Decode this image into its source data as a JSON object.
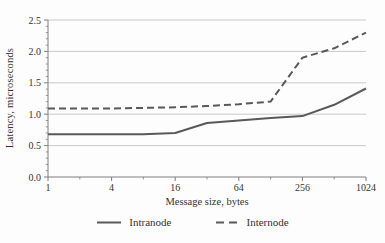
{
  "chart_data": {
    "type": "line",
    "title": "",
    "xlabel": "Message size, bytes",
    "ylabel": "Latency, microseconds",
    "x_scale": "log",
    "x": [
      1,
      2,
      4,
      8,
      16,
      32,
      64,
      128,
      256,
      512,
      1024
    ],
    "x_major_ticks": [
      1,
      4,
      16,
      64,
      256,
      1024
    ],
    "x_tick_labels": [
      "1",
      "4",
      "16",
      "64",
      "256",
      "1024"
    ],
    "x_minor_ticks": [
      2,
      8,
      32,
      128,
      512
    ],
    "ylim": [
      0.0,
      2.5
    ],
    "y_major_step": 0.5,
    "y_minor_step": 0.1,
    "y_tick_labels": [
      "0.0",
      "0.5",
      "1.0",
      "1.5",
      "2.0",
      "2.5"
    ],
    "grid": "horizontal-major",
    "legend_position": "bottom-center",
    "series": [
      {
        "name": "Intranode",
        "line": "solid",
        "color": "#595959",
        "values": [
          0.68,
          0.68,
          0.68,
          0.68,
          0.7,
          0.86,
          0.9,
          0.94,
          0.97,
          1.15,
          1.41
        ]
      },
      {
        "name": "Internode",
        "line": "dashed",
        "color": "#595959",
        "values": [
          1.09,
          1.09,
          1.09,
          1.1,
          1.11,
          1.13,
          1.16,
          1.2,
          1.9,
          2.05,
          2.3
        ]
      }
    ],
    "colors": {
      "grid": "#c9c9c9",
      "axis": "#7f7f7f",
      "text": "#333333",
      "background": "#fdfdfd"
    }
  }
}
